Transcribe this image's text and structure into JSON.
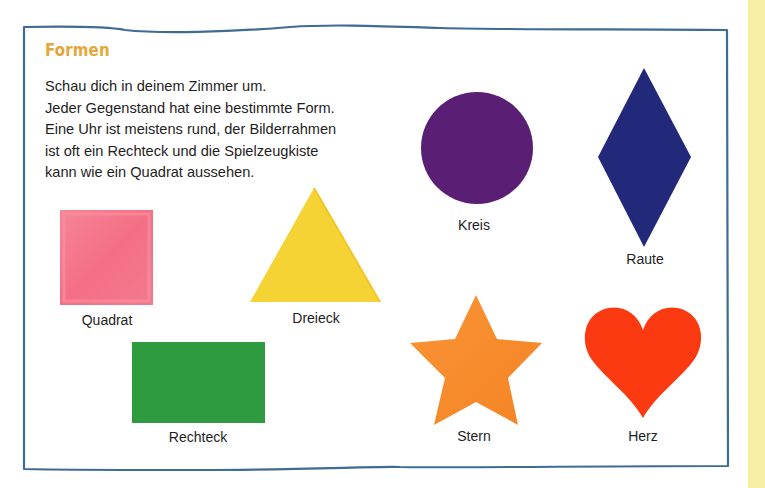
{
  "page": {
    "title": "Formen",
    "intro_lines": [
      "Schau dich in deinem Zimmer um.",
      "Jeder Gegenstand hat eine bestimmte Form.",
      "Eine Uhr ist meistens rund, der Bilderrahmen",
      "ist oft ein Rechteck und die Spielzeugkiste",
      "kann wie ein Quadrat aussehen."
    ]
  },
  "shapes": [
    {
      "id": "quadrat",
      "label": "Quadrat",
      "color": "#f46f85"
    },
    {
      "id": "dreieck",
      "label": "Dreieck",
      "color": "#f6d335"
    },
    {
      "id": "rechteck",
      "label": "Rechteck",
      "color": "#2f9b3f"
    },
    {
      "id": "kreis",
      "label": "Kreis",
      "color": "#5a1f74"
    },
    {
      "id": "raute",
      "label": "Raute",
      "color": "#22287a"
    },
    {
      "id": "stern",
      "label": "Stern",
      "color": "#f78b2a"
    },
    {
      "id": "herz",
      "label": "Herz",
      "color": "#fb3a12"
    }
  ],
  "colors": {
    "title": "#e3a73a",
    "frame_border": "#3f6b94",
    "side_strip": "#f7f0a4"
  }
}
